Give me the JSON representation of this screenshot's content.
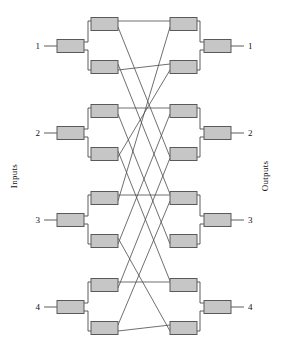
{
  "figure": {
    "kind": "switching-network-diagram",
    "name": "3-stage rearrangeable switching network",
    "width": 288,
    "height": 353,
    "background_color": "#ffffff"
  },
  "labels": {
    "left_side": "Inputs",
    "right_side": "Outputs",
    "input_ports": [
      "1",
      "2",
      "3",
      "4"
    ],
    "output_ports": [
      "1",
      "2",
      "3",
      "4"
    ]
  },
  "style": {
    "box_fill": "#c6c6c6",
    "box_stroke": "#5a5a5a",
    "wire_stroke": "#4a4a4a",
    "label_color": "#111111"
  },
  "geometry": {
    "box_w": 27,
    "box_h": 13,
    "input_x": 57,
    "mid_left_x": 91,
    "mid_right_x": 170,
    "output_x": 204,
    "group_centers_y": [
      46,
      133,
      220,
      307
    ],
    "mid_pair_offset": 22,
    "port_label_x_left": 40,
    "port_label_x_right": 248,
    "lead_left_start": 44,
    "lead_right_end": 244
  },
  "nodes": {
    "input_stage": [
      {
        "id": "in1",
        "port": "1",
        "cx": 70.5,
        "cy": 46
      },
      {
        "id": "in2",
        "port": "2",
        "cx": 70.5,
        "cy": 133
      },
      {
        "id": "in3",
        "port": "3",
        "cx": 70.5,
        "cy": 220
      },
      {
        "id": "in4",
        "port": "4",
        "cx": 70.5,
        "cy": 307
      }
    ],
    "middle_left_stage": [
      {
        "id": "ml1",
        "cx": 104.5,
        "cy": 24
      },
      {
        "id": "ml2",
        "cx": 104.5,
        "cy": 67
      },
      {
        "id": "ml3",
        "cx": 104.5,
        "cy": 111
      },
      {
        "id": "ml4",
        "cx": 104.5,
        "cy": 154
      },
      {
        "id": "ml5",
        "cx": 104.5,
        "cy": 198
      },
      {
        "id": "ml6",
        "cx": 104.5,
        "cy": 241
      },
      {
        "id": "ml7",
        "cx": 104.5,
        "cy": 285
      },
      {
        "id": "ml8",
        "cx": 104.5,
        "cy": 328
      }
    ],
    "middle_right_stage": [
      {
        "id": "mr1",
        "cx": 183.5,
        "cy": 24
      },
      {
        "id": "mr2",
        "cx": 183.5,
        "cy": 67
      },
      {
        "id": "mr3",
        "cx": 183.5,
        "cy": 111
      },
      {
        "id": "mr4",
        "cx": 183.5,
        "cy": 154
      },
      {
        "id": "mr5",
        "cx": 183.5,
        "cy": 198
      },
      {
        "id": "mr6",
        "cx": 183.5,
        "cy": 241
      },
      {
        "id": "mr7",
        "cx": 183.5,
        "cy": 285
      },
      {
        "id": "mr8",
        "cx": 183.5,
        "cy": 328
      }
    ],
    "output_stage": [
      {
        "id": "out1",
        "port": "1",
        "cx": 217.5,
        "cy": 46
      },
      {
        "id": "out2",
        "port": "2",
        "cx": 217.5,
        "cy": 133
      },
      {
        "id": "out3",
        "port": "3",
        "cx": 217.5,
        "cy": 220
      },
      {
        "id": "out4",
        "port": "4",
        "cx": 217.5,
        "cy": 307
      }
    ]
  },
  "edges": {
    "input_to_middle_left": [
      {
        "from": "in1",
        "to": "ml1"
      },
      {
        "from": "in1",
        "to": "ml2"
      },
      {
        "from": "in2",
        "to": "ml3"
      },
      {
        "from": "in2",
        "to": "ml4"
      },
      {
        "from": "in3",
        "to": "ml5"
      },
      {
        "from": "in3",
        "to": "ml6"
      },
      {
        "from": "in4",
        "to": "ml7"
      },
      {
        "from": "in4",
        "to": "ml8"
      }
    ],
    "middle_right_to_output": [
      {
        "from": "mr1",
        "to": "out1"
      },
      {
        "from": "mr2",
        "to": "out1"
      },
      {
        "from": "mr3",
        "to": "out2"
      },
      {
        "from": "mr4",
        "to": "out2"
      },
      {
        "from": "mr5",
        "to": "out3"
      },
      {
        "from": "mr6",
        "to": "out3"
      },
      {
        "from": "mr7",
        "to": "out4"
      },
      {
        "from": "mr8",
        "to": "out4"
      }
    ],
    "crossbar": [
      {
        "from": "ml1",
        "to": "mr1"
      },
      {
        "from": "ml1",
        "to": "mr4"
      },
      {
        "from": "ml2",
        "to": "mr2"
      },
      {
        "from": "ml2",
        "to": "mr5"
      },
      {
        "from": "ml3",
        "to": "mr3"
      },
      {
        "from": "ml3",
        "to": "mr6"
      },
      {
        "from": "ml4",
        "to": "mr2"
      },
      {
        "from": "ml4",
        "to": "mr7"
      },
      {
        "from": "ml5",
        "to": "mr5"
      },
      {
        "from": "ml5",
        "to": "mr1"
      },
      {
        "from": "ml6",
        "to": "mr6"
      },
      {
        "from": "ml6",
        "to": "mr3"
      },
      {
        "from": "ml7",
        "to": "mr7"
      },
      {
        "from": "ml7",
        "to": "mr4"
      },
      {
        "from": "ml8",
        "to": "mr8"
      },
      {
        "from": "ml8",
        "to": "mr8b"
      }
    ]
  }
}
